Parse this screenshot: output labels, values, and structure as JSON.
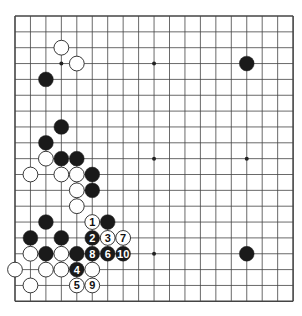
{
  "diagram": {
    "type": "go-board",
    "size": 19,
    "board_color": "#ffffff",
    "line_color": "#444444",
    "black_color": "#1a1a1a",
    "white_color": "#ffffff",
    "hoshi": [
      [
        3,
        3
      ],
      [
        9,
        3
      ],
      [
        15,
        3
      ],
      [
        3,
        9
      ],
      [
        9,
        9
      ],
      [
        15,
        9
      ],
      [
        3,
        15
      ],
      [
        9,
        15
      ],
      [
        15,
        15
      ]
    ],
    "stones": [
      {
        "c": 3,
        "r": 2,
        "color": "white"
      },
      {
        "c": 4,
        "r": 3,
        "color": "white"
      },
      {
        "c": 15,
        "r": 3,
        "color": "black"
      },
      {
        "c": 2,
        "r": 4,
        "color": "black"
      },
      {
        "c": 3,
        "r": 7,
        "color": "black"
      },
      {
        "c": 2,
        "r": 8,
        "color": "black"
      },
      {
        "c": 2,
        "r": 9,
        "color": "white"
      },
      {
        "c": 3,
        "r": 9,
        "color": "black"
      },
      {
        "c": 4,
        "r": 9,
        "color": "black"
      },
      {
        "c": 1,
        "r": 10,
        "color": "white"
      },
      {
        "c": 3,
        "r": 10,
        "color": "white"
      },
      {
        "c": 4,
        "r": 10,
        "color": "white"
      },
      {
        "c": 5,
        "r": 10,
        "color": "black"
      },
      {
        "c": 4,
        "r": 11,
        "color": "white"
      },
      {
        "c": 5,
        "r": 11,
        "color": "black"
      },
      {
        "c": 4,
        "r": 12,
        "color": "white"
      },
      {
        "c": 2,
        "r": 13,
        "color": "black"
      },
      {
        "c": 5,
        "r": 13,
        "color": "white",
        "label": "1"
      },
      {
        "c": 6,
        "r": 13,
        "color": "black"
      },
      {
        "c": 1,
        "r": 14,
        "color": "black"
      },
      {
        "c": 3,
        "r": 14,
        "color": "black"
      },
      {
        "c": 5,
        "r": 14,
        "color": "black",
        "label": "2"
      },
      {
        "c": 6,
        "r": 14,
        "color": "white",
        "label": "3"
      },
      {
        "c": 7,
        "r": 14,
        "color": "white",
        "label": "7"
      },
      {
        "c": 1,
        "r": 15,
        "color": "white"
      },
      {
        "c": 2,
        "r": 15,
        "color": "black"
      },
      {
        "c": 3,
        "r": 15,
        "color": "white"
      },
      {
        "c": 4,
        "r": 15,
        "color": "black"
      },
      {
        "c": 5,
        "r": 15,
        "color": "black",
        "label": "8"
      },
      {
        "c": 6,
        "r": 15,
        "color": "black",
        "label": "6"
      },
      {
        "c": 7,
        "r": 15,
        "color": "black",
        "label": "10"
      },
      {
        "c": 15,
        "r": 15,
        "color": "black"
      },
      {
        "c": 0,
        "r": 16,
        "color": "white"
      },
      {
        "c": 2,
        "r": 16,
        "color": "white"
      },
      {
        "c": 3,
        "r": 16,
        "color": "white"
      },
      {
        "c": 4,
        "r": 16,
        "color": "black",
        "label": "4"
      },
      {
        "c": 5,
        "r": 16,
        "color": "white"
      },
      {
        "c": 1,
        "r": 17,
        "color": "white"
      },
      {
        "c": 4,
        "r": 17,
        "color": "white",
        "label": "5"
      },
      {
        "c": 5,
        "r": 17,
        "color": "white",
        "label": "9"
      }
    ]
  }
}
